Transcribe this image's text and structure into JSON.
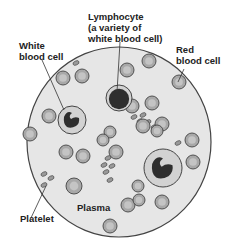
{
  "diagram": {
    "labels": {
      "lymphocyte": [
        "Lymphocyte",
        "(a variety of",
        "white blood cell)"
      ],
      "white_blood_cell": [
        "White",
        "blood cell"
      ],
      "red_blood_cell": [
        "Red",
        "blood cell"
      ],
      "platelet": "Platelet",
      "plasma": "Plasma"
    },
    "colors": {
      "plasma": "#e6e6e6",
      "outline": "#444444",
      "rbc_fill": "#a8a8a8",
      "rbc_center": "#c4c4c4",
      "wbc_fill": "#d2d2d2",
      "nucleus": "#2e2e2e",
      "platelet": "#9a9a9a"
    },
    "field": {
      "cx": 119,
      "cy": 142,
      "rx": 92,
      "ry": 95
    },
    "red_blood_cells": [
      [
        63,
        78,
        7
      ],
      [
        82,
        76,
        7
      ],
      [
        127,
        70,
        7
      ],
      [
        149,
        61,
        7
      ],
      [
        179,
        82,
        7
      ],
      [
        49,
        116,
        7
      ],
      [
        30,
        134,
        7
      ],
      [
        132,
        106,
        7
      ],
      [
        152,
        103,
        7
      ],
      [
        143,
        126,
        7
      ],
      [
        110,
        132,
        6
      ],
      [
        116,
        152,
        7
      ],
      [
        162,
        124,
        7
      ],
      [
        192,
        140,
        7
      ],
      [
        193,
        162,
        7
      ],
      [
        103,
        140,
        6
      ],
      [
        66,
        152,
        7
      ],
      [
        83,
        156,
        7
      ],
      [
        74,
        186,
        8
      ],
      [
        138,
        186,
        6
      ],
      [
        128,
        205,
        7
      ],
      [
        139,
        200,
        6
      ],
      [
        162,
        202,
        7
      ],
      [
        110,
        226,
        7
      ],
      [
        157,
        131,
        6
      ]
    ],
    "white_blood_cells": [
      {
        "cx": 72,
        "cy": 120,
        "r": 14
      },
      {
        "cx": 163,
        "cy": 168,
        "r": 19
      }
    ],
    "lymphocyte": {
      "cx": 119,
      "cy": 98,
      "r": 13
    },
    "platelets": [
      [
        76,
        63
      ],
      [
        134,
        117
      ],
      [
        143,
        115
      ],
      [
        140,
        121
      ],
      [
        148,
        122
      ],
      [
        154,
        127
      ],
      [
        108,
        158
      ],
      [
        104,
        165
      ],
      [
        112,
        166
      ],
      [
        106,
        172
      ],
      [
        110,
        180
      ],
      [
        44,
        174
      ],
      [
        51,
        178
      ],
      [
        44,
        185
      ],
      [
        178,
        143
      ]
    ],
    "leaders": [
      {
        "from": [
          120,
          42
        ],
        "to": [
          117,
          92
        ]
      },
      {
        "from": [
          42,
          60
        ],
        "to": [
          64,
          110
        ]
      },
      {
        "from": [
          184,
          69
        ],
        "to": [
          178,
          82
        ]
      },
      {
        "from": [
          30,
          220
        ],
        "to": [
          46,
          186
        ]
      }
    ]
  }
}
